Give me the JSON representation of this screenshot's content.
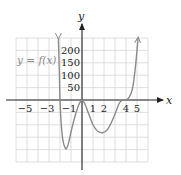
{
  "chart_data": {
    "type": "line",
    "title": "",
    "function_label": "y = f(x)",
    "xlabel": "x",
    "ylabel": "y",
    "xlim": [
      -6,
      6
    ],
    "ylim": [
      -250,
      250
    ],
    "grid": true,
    "x_grid_step": 1,
    "y_grid_step": 50,
    "x_ticks": [
      {
        "value": -5,
        "label": "−5"
      },
      {
        "value": -3,
        "label": "−3"
      },
      {
        "value": -1,
        "label": "−1"
      },
      {
        "value": 1,
        "label": "1"
      },
      {
        "value": 2,
        "label": "2"
      },
      {
        "value": 4,
        "label": "4"
      },
      {
        "value": 5,
        "label": "5"
      }
    ],
    "y_ticks": [
      {
        "value": 50,
        "label": "50"
      },
      {
        "value": 100,
        "label": "100"
      },
      {
        "value": 150,
        "label": "150"
      },
      {
        "value": 200,
        "label": "200"
      }
    ],
    "series": [
      {
        "name": "f(x)",
        "color": "#8a8a8a",
        "arrow_ends": true,
        "points": [
          [
            -2.15,
            250
          ],
          [
            -2.1,
            180
          ],
          [
            -2.05,
            90
          ],
          [
            -2.0,
            0
          ],
          [
            -1.9,
            -90
          ],
          [
            -1.75,
            -160
          ],
          [
            -1.55,
            -192
          ],
          [
            -1.4,
            -195
          ],
          [
            -1.2,
            -170
          ],
          [
            -0.9,
            -110
          ],
          [
            -0.6,
            -60
          ],
          [
            -0.3,
            -20
          ],
          [
            0,
            0
          ],
          [
            0.3,
            -20
          ],
          [
            0.6,
            -55
          ],
          [
            1.0,
            -100
          ],
          [
            1.4,
            -125
          ],
          [
            1.9,
            -132
          ],
          [
            2.3,
            -120
          ],
          [
            2.7,
            -88
          ],
          [
            3.1,
            -45
          ],
          [
            3.4,
            -12
          ],
          [
            3.7,
            -1
          ],
          [
            4.0,
            0
          ],
          [
            4.2,
            6
          ],
          [
            4.45,
            25
          ],
          [
            4.65,
            60
          ],
          [
            4.85,
            130
          ],
          [
            5.0,
            200
          ],
          [
            5.1,
            250
          ]
        ]
      }
    ],
    "colors": {
      "axis": "#222222",
      "grid": "#d6d6d6",
      "curve": "#8a8a8a",
      "label": "#8a8a8a"
    }
  }
}
